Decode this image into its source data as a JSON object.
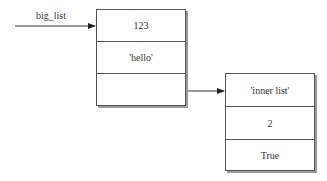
{
  "diagram": {
    "variable": {
      "name": "big_list"
    },
    "outer_list": {
      "cells": [
        "123",
        "'hello'",
        ""
      ]
    },
    "inner_list": {
      "cells": [
        "'inner list'",
        "2",
        "True"
      ]
    }
  }
}
